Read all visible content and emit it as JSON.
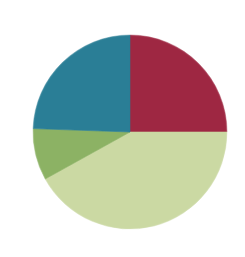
{
  "figure": {
    "title": "",
    "background_color": "#FFFFFF",
    "width": 245,
    "height": 257
  },
  "chart_data": {
    "type": "pie",
    "title": "",
    "xlabel": "",
    "ylabel": "",
    "legend": "none",
    "grid": false,
    "start_angle_deg": 0,
    "direction": "clockwise",
    "center": {
      "x": 130,
      "y": 132
    },
    "radius": 97,
    "labels": [
      "Slice 1",
      "Slice 2",
      "Slice 3",
      "Slice 4"
    ],
    "values": [
      25.0,
      42.0,
      8.6,
      24.4
    ],
    "units": "percent",
    "colors": [
      "#9E2742",
      "#CBD9A3",
      "#8CB264",
      "#2A7E96"
    ],
    "slices": [
      {
        "label": "Slice 1",
        "value": 25.0,
        "color": "#9E2742",
        "color_name": "crimson",
        "start_angle_deg": 0,
        "end_angle_deg": 90,
        "sweep_deg": 90,
        "data_label": ""
      },
      {
        "label": "Slice 2",
        "value": 42.0,
        "color": "#CBD9A3",
        "color_name": "pale-green",
        "start_angle_deg": 90,
        "end_angle_deg": 241,
        "sweep_deg": 151,
        "data_label": ""
      },
      {
        "label": "Slice 3",
        "value": 8.6,
        "color": "#8CB264",
        "color_name": "medium-green",
        "start_angle_deg": 241,
        "end_angle_deg": 272,
        "sweep_deg": 31,
        "data_label": ""
      },
      {
        "label": "Slice 4",
        "value": 24.4,
        "color": "#2A7E96",
        "color_name": "teal",
        "start_angle_deg": 272,
        "end_angle_deg": 360,
        "sweep_deg": 88,
        "data_label": ""
      }
    ]
  }
}
